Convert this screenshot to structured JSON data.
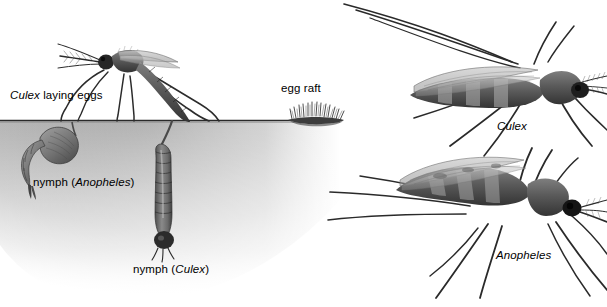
{
  "figure": {
    "background_color": "#ffffff",
    "water_color": "#b8b8b8",
    "ink_color": "#1c1c1c",
    "width": 607,
    "height": 307
  },
  "labels": {
    "culex_laying": {
      "italic": "Culex",
      "roman": " laying eggs"
    },
    "egg_raft": {
      "text": "egg raft"
    },
    "nymph_anopheles": {
      "prefix": "nymph (",
      "italic": "Anopheles",
      "suffix": ")"
    },
    "nymph_culex": {
      "prefix": "nymph (",
      "italic": "Culex",
      "suffix": ")"
    },
    "adult_culex": {
      "italic": "Culex"
    },
    "adult_anopheles": {
      "italic": "Anopheles"
    }
  },
  "scene": {
    "waterline_y": 120,
    "left_panel": {
      "name": "aquatic-habitat-scene",
      "items": [
        "culex-adult-laying-eggs",
        "egg-raft-floating",
        "anopheles-pupa-nymph",
        "culex-larva-nymph",
        "water-surface-line",
        "water-body"
      ]
    },
    "right_panel": {
      "name": "adult-posture-comparison",
      "items": [
        "culex-adult-horizontal-posture",
        "anopheles-adult-angled-posture"
      ]
    }
  }
}
